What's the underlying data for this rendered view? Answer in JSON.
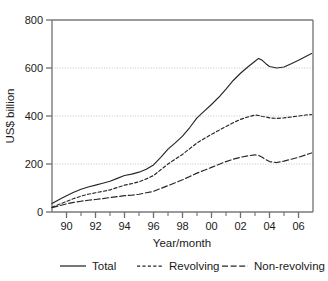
{
  "chart_data": {
    "type": "line",
    "title": "",
    "xlabel": "Year/month",
    "ylabel": "US$ billion",
    "xlim": [
      1989.0,
      2007.0
    ],
    "ylim": [
      0,
      800
    ],
    "grid": "horizontal dotted gridlines at 200, 400, 600",
    "legend_position": "bottom-center-outside",
    "x_tick_labels": [
      "90",
      "92",
      "94",
      "96",
      "98",
      "00",
      "02",
      "04",
      "06"
    ],
    "x_tick_values": [
      1990,
      1992,
      1994,
      1996,
      1998,
      2000,
      2002,
      2004,
      2006
    ],
    "x_minor_tick_values": [
      1991,
      1993,
      1995,
      1997,
      1999,
      2001,
      2003,
      2005
    ],
    "y_tick_labels": [
      "0",
      "200",
      "400",
      "600",
      "800"
    ],
    "y_tick_values": [
      0,
      200,
      400,
      600,
      800
    ],
    "x": [
      1989.0,
      1989.5,
      1990.0,
      1990.5,
      1991.0,
      1991.5,
      1992.0,
      1992.5,
      1993.0,
      1993.5,
      1994.0,
      1994.5,
      1995.0,
      1995.5,
      1996.0,
      1996.5,
      1997.0,
      1997.5,
      1998.0,
      1998.5,
      1999.0,
      1999.5,
      2000.0,
      2000.5,
      2001.0,
      2001.5,
      2002.0,
      2002.5,
      2003.0,
      2003.25,
      2003.5,
      2003.75,
      2004.0,
      2004.5,
      2005.0,
      2005.5,
      2006.0,
      2006.5,
      2006.9
    ],
    "series": [
      {
        "name": "Total",
        "style": "solid",
        "values": [
          35,
          52,
          68,
          82,
          95,
          104,
          112,
          120,
          128,
          140,
          152,
          158,
          166,
          178,
          196,
          228,
          262,
          288,
          316,
          352,
          392,
          420,
          448,
          478,
          512,
          548,
          578,
          604,
          628,
          640,
          632,
          618,
          606,
          600,
          604,
          618,
          632,
          648,
          660
        ]
      },
      {
        "name": "Revolving",
        "style": "dashed-short",
        "values": [
          20,
          32,
          44,
          56,
          66,
          74,
          80,
          86,
          92,
          102,
          112,
          118,
          126,
          138,
          152,
          176,
          200,
          220,
          240,
          264,
          288,
          306,
          324,
          340,
          356,
          372,
          386,
          396,
          404,
          402,
          398,
          396,
          392,
          390,
          392,
          396,
          400,
          404,
          406
        ]
      },
      {
        "name": "Non-revolving",
        "style": "dashed-long",
        "values": [
          18,
          26,
          34,
          40,
          45,
          49,
          52,
          56,
          60,
          64,
          68,
          70,
          74,
          80,
          86,
          98,
          110,
          122,
          134,
          148,
          162,
          174,
          186,
          198,
          210,
          220,
          228,
          234,
          238,
          236,
          228,
          218,
          210,
          206,
          212,
          220,
          228,
          238,
          246
        ]
      }
    ]
  },
  "legend": {
    "items": [
      {
        "label": "Total",
        "style": "solid"
      },
      {
        "label": "Revolving",
        "style": "dashed-short"
      },
      {
        "label": "Non-revolving",
        "style": "dashed-long"
      }
    ]
  }
}
